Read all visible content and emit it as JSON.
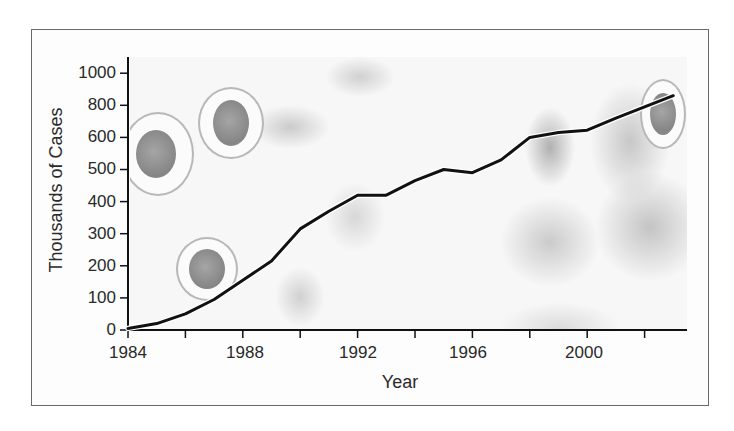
{
  "chart_data": {
    "type": "line",
    "title": "",
    "xlabel": "Year",
    "ylabel": "Thousands of Cases",
    "x": [
      1984,
      1985,
      1986,
      1987,
      1988,
      1989,
      1990,
      1991,
      1992,
      1993,
      1994,
      1995,
      1996,
      1997,
      1998,
      1999,
      2000,
      2001,
      2002,
      2003
    ],
    "series": [
      {
        "name": "Cases",
        "color": "#111111",
        "values": [
          5,
          20,
          50,
          95,
          155,
          215,
          315,
          370,
          420,
          420,
          465,
          500,
          490,
          530,
          600,
          630,
          645,
          720,
          790,
          860
        ]
      }
    ],
    "x_ticks": [
      "1984",
      "1988",
      "1992",
      "1996",
      "2000"
    ],
    "x_minor_ticks": [
      1986,
      1990,
      1994,
      1998,
      2002
    ],
    "y_ticks": [
      "0",
      "100",
      "200",
      "300",
      "400",
      "500",
      "600",
      "800",
      "1000"
    ],
    "y_scale_note": "non-linear: equal spacing between ticks 0-600 by 100, then 800, 1000",
    "xlim": [
      1984,
      2004
    ],
    "ylim": [
      0,
      1000
    ],
    "grid": false,
    "legend": null,
    "background": "faded grayscale micrograph of cells"
  },
  "axes": {
    "x_title": "Year",
    "y_title": "Thousands of Cases",
    "x_tick_labels": [
      "1984",
      "1988",
      "1992",
      "1996",
      "2000"
    ],
    "y_tick_labels": [
      "1000",
      "800",
      "600",
      "500",
      "400",
      "300",
      "200",
      "100",
      "0"
    ]
  }
}
